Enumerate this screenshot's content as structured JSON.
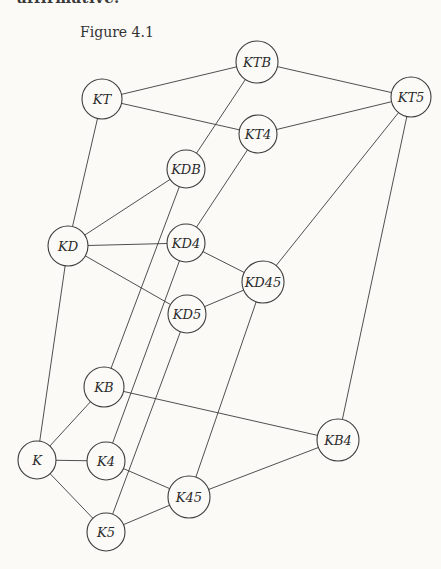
{
  "page": {
    "truncated_text_top": "affirmative.",
    "figure_caption": "Figure 4.1"
  },
  "colors": {
    "paper": "#fbfaf7",
    "ink": "#3c3c3c",
    "text": "#2b2b2b"
  },
  "graph": {
    "description": "Inclusion diagram of fifteen modal logic systems",
    "nodes": [
      {
        "id": "KT",
        "label": "KT",
        "x": 102,
        "y": 99,
        "r": 20
      },
      {
        "id": "KTB",
        "label": "KTB",
        "x": 257,
        "y": 62,
        "r": 21
      },
      {
        "id": "KT5",
        "label": "KT5",
        "x": 411,
        "y": 97,
        "r": 20
      },
      {
        "id": "KT4",
        "label": "KT4",
        "x": 258,
        "y": 134,
        "r": 19
      },
      {
        "id": "KDB",
        "label": "KDB",
        "x": 186,
        "y": 169,
        "r": 19
      },
      {
        "id": "KD",
        "label": "KD",
        "x": 68,
        "y": 246,
        "r": 20
      },
      {
        "id": "KD4",
        "label": "KD4",
        "x": 186,
        "y": 243,
        "r": 19
      },
      {
        "id": "KD45",
        "label": "KD45",
        "x": 263,
        "y": 282,
        "r": 21
      },
      {
        "id": "KD5",
        "label": "KD5",
        "x": 187,
        "y": 314,
        "r": 19
      },
      {
        "id": "KB",
        "label": "KB",
        "x": 104,
        "y": 387,
        "r": 20
      },
      {
        "id": "KB4",
        "label": "KB4",
        "x": 338,
        "y": 440,
        "r": 21
      },
      {
        "id": "K",
        "label": "K",
        "x": 37,
        "y": 460,
        "r": 19
      },
      {
        "id": "K4",
        "label": "K4",
        "x": 106,
        "y": 461,
        "r": 19
      },
      {
        "id": "K45",
        "label": "K45",
        "x": 189,
        "y": 497,
        "r": 21
      },
      {
        "id": "K5",
        "label": "K5",
        "x": 106,
        "y": 532,
        "r": 19
      }
    ],
    "edges": [
      [
        "K",
        "KD"
      ],
      [
        "K",
        "KB"
      ],
      [
        "K",
        "K4"
      ],
      [
        "K",
        "K5"
      ],
      [
        "KD",
        "KT"
      ],
      [
        "KD",
        "KDB"
      ],
      [
        "KD",
        "KD4"
      ],
      [
        "KD",
        "KD5"
      ],
      [
        "KB",
        "KDB"
      ],
      [
        "KB",
        "KB4"
      ],
      [
        "K4",
        "KD4"
      ],
      [
        "K4",
        "K45"
      ],
      [
        "K5",
        "KD5"
      ],
      [
        "K5",
        "K45"
      ],
      [
        "K45",
        "KD45"
      ],
      [
        "K45",
        "KB4"
      ],
      [
        "KDB",
        "KTB"
      ],
      [
        "KD4",
        "KT4"
      ],
      [
        "KD4",
        "KD45"
      ],
      [
        "KD5",
        "KD45"
      ],
      [
        "KD45",
        "KT5"
      ],
      [
        "KB4",
        "KT5"
      ],
      [
        "KT",
        "KTB"
      ],
      [
        "KT",
        "KT4"
      ],
      [
        "KT4",
        "KT5"
      ],
      [
        "KTB",
        "KT5"
      ]
    ]
  }
}
